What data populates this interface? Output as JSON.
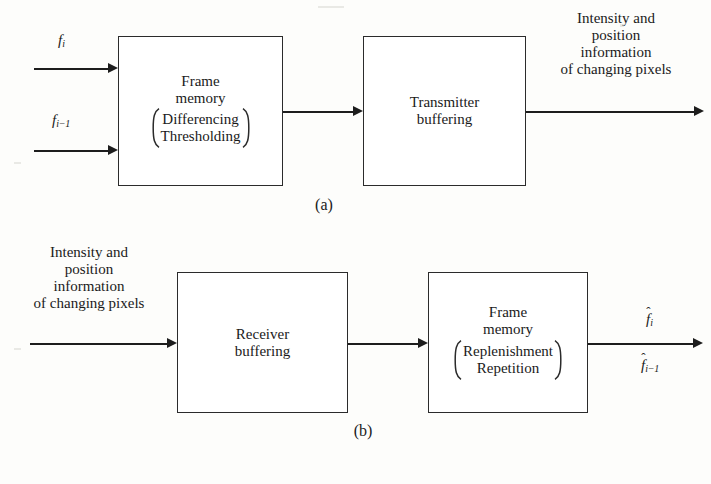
{
  "figure": {
    "kind": "block-diagram",
    "background_color": "#fdfdfb",
    "line_color": "#1d1d1d"
  },
  "panel_a": {
    "caption": "(a)",
    "inputs": [
      {
        "symbol": "f",
        "subscript": "i",
        "hat": false
      },
      {
        "symbol": "f",
        "subscript": "i−1",
        "hat": false
      }
    ],
    "blocks": [
      {
        "id": "frame-memory-tx",
        "title_lines": [
          "Frame",
          "memory"
        ],
        "bracketed_lines": [
          "Differencing",
          "Thresholding"
        ]
      },
      {
        "id": "transmitter-buffering",
        "title_lines": [
          "Transmitter",
          "buffering"
        ],
        "bracketed_lines": []
      }
    ],
    "output_label_lines": [
      "Intensity and",
      "position",
      "information",
      "of changing pixels"
    ]
  },
  "panel_b": {
    "caption": "(b)",
    "input_label_lines": [
      "Intensity and",
      "position",
      "information",
      "of changing pixels"
    ],
    "blocks": [
      {
        "id": "receiver-buffering",
        "title_lines": [
          "Receiver",
          "buffering"
        ],
        "bracketed_lines": []
      },
      {
        "id": "frame-memory-rx",
        "title_lines": [
          "Frame",
          "memory"
        ],
        "bracketed_lines": [
          "Replenishment",
          "Repetition"
        ]
      }
    ],
    "outputs": [
      {
        "symbol": "f",
        "subscript": "i",
        "hat": true,
        "hat_glyph": "ˆ"
      },
      {
        "symbol": "f",
        "subscript": "i−1",
        "hat": true,
        "hat_glyph": "ˆ"
      }
    ]
  }
}
